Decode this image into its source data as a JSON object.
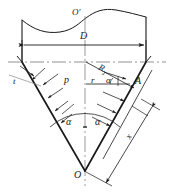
{
  "figure": {
    "type": "engineering-cross-section-diagram",
    "stroke_color": "#1a1a1a",
    "centerline_color": "#8a8a8a",
    "background": "#ffffff"
  },
  "labels": {
    "apex_top": "O'",
    "apex_bottom": "O",
    "diameter": "D",
    "radius_outer": "R",
    "radius_outer_sub": "2",
    "radius_inner": "r",
    "thickness": "t",
    "pressure": "p",
    "point_a": "A",
    "angle_left": "α",
    "angle_right": "α",
    "angle_small": "α",
    "slant_distance": "x"
  },
  "geometry": {
    "apex_bottom_x": 85,
    "apex_bottom_y": 171,
    "centerline_x": 85,
    "horizontal_ref_y": 62,
    "dimension_line_y": 45,
    "top_break_y": 14,
    "left_wall_top_x": 22,
    "right_wall_top_x": 146,
    "point_a_x": 130,
    "point_a_y": 82
  }
}
